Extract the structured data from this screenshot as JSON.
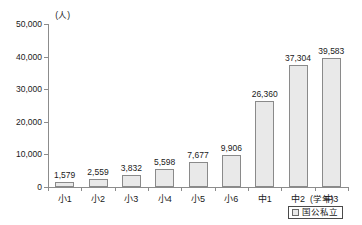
{
  "chart_data": {
    "type": "bar",
    "title": "",
    "xlabel": "(学年)",
    "ylabel": "(人)",
    "categories": [
      "小1",
      "小2",
      "小3",
      "小4",
      "小5",
      "小6",
      "中1",
      "中2",
      "中3"
    ],
    "values": [
      1579,
      2559,
      3832,
      5598,
      7677,
      9906,
      26360,
      37304,
      39583
    ],
    "value_labels": [
      "1,579",
      "2,559",
      "3,832",
      "5,598",
      "7,677",
      "9,906",
      "26,360",
      "37,304",
      "39,583"
    ],
    "ylim": [
      0,
      50000
    ],
    "yticks": [
      0,
      10000,
      20000,
      30000,
      40000,
      50000
    ],
    "ytick_labels": [
      "0",
      "10,000",
      "20,000",
      "30,000",
      "40,000",
      "50,000"
    ],
    "grid": false,
    "legend": [
      {
        "label": "国公私立",
        "color": "#e9e9e9"
      }
    ],
    "legend_position": "bottom-right",
    "series": [
      {
        "name": "国公私立",
        "values": [
          1579,
          2559,
          3832,
          5598,
          7677,
          9906,
          26360,
          37304,
          39583
        ]
      }
    ]
  },
  "colors": {
    "bar_fill": "#e9e9e9",
    "bar_border": "#8a8a8a",
    "axis": "#8c8c8c",
    "text": "#1a1a1a",
    "background": "#ffffff"
  }
}
